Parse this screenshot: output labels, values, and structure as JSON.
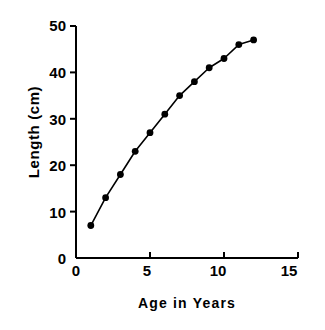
{
  "chart_data": {
    "type": "line",
    "title": "",
    "xlabel": "Age in Years",
    "ylabel": "Length (cm)",
    "x": [
      1,
      2,
      3,
      4,
      5,
      6,
      7,
      8,
      9,
      10,
      11,
      12
    ],
    "values": [
      7,
      13,
      18,
      23,
      27,
      31,
      35,
      38,
      41,
      43,
      46,
      47
    ],
    "series": [
      {
        "name": "Length",
        "x": [
          1,
          2,
          3,
          4,
          5,
          6,
          7,
          8,
          9,
          10,
          11,
          12
        ],
        "values": [
          7,
          13,
          18,
          23,
          27,
          31,
          35,
          38,
          41,
          43,
          46,
          47
        ]
      }
    ],
    "xlim": [
      0,
      15
    ],
    "ylim": [
      0,
      50
    ],
    "xticks": [
      0,
      5,
      10,
      15
    ],
    "yticks": [
      0,
      10,
      20,
      30,
      40,
      50
    ],
    "xtick_labels": [
      "0",
      "5",
      "10",
      "15"
    ],
    "ytick_labels": [
      "0",
      "10",
      "20",
      "30",
      "40",
      "50"
    ],
    "grid": false,
    "legend": false,
    "marker": "filled-circle",
    "line_color": "#000000",
    "marker_color": "#000000",
    "axis_color": "#000000",
    "background": "#ffffff"
  }
}
